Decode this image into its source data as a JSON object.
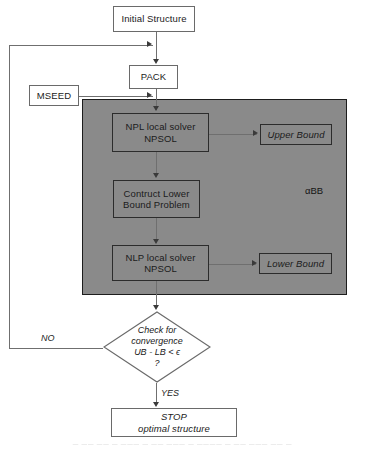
{
  "diagram": {
    "colors": {
      "page_background": "#ffffff",
      "node_fill": "#ffffff",
      "node_border": "#6a6a6a",
      "region_fill": "#8a8a8a",
      "region_border": "#1d1d1d",
      "connector": "#6f6f6f",
      "arrow": "#3a3a3a",
      "text": "#1b1b1b"
    },
    "nodes": [
      {
        "id": "initial-structure",
        "name": "initial-structure-box",
        "shape": "rect",
        "lines": [
          "Initial Structure"
        ],
        "italic": false,
        "on_gray": false,
        "x": 113,
        "y": 6,
        "w": 82,
        "h": 26
      },
      {
        "id": "pack",
        "name": "pack-box",
        "shape": "rect",
        "lines": [
          "PACK"
        ],
        "italic": false,
        "on_gray": false,
        "x": 129,
        "y": 65,
        "w": 49,
        "h": 24
      },
      {
        "id": "mseed",
        "name": "mseed-box",
        "shape": "rect",
        "lines": [
          "MSEED"
        ],
        "italic": false,
        "on_gray": false,
        "x": 29,
        "y": 85,
        "w": 50,
        "h": 21
      },
      {
        "id": "npl-solver",
        "name": "npl-local-solver-box",
        "shape": "rect",
        "lines": [
          "NPL local solver",
          "NPSOL"
        ],
        "italic": false,
        "on_gray": true,
        "x": 112,
        "y": 113,
        "w": 97,
        "h": 39
      },
      {
        "id": "upper-bound",
        "name": "upper-bound-box",
        "shape": "rect",
        "lines": [
          "Upper Bound"
        ],
        "italic": true,
        "on_gray": true,
        "x": 260,
        "y": 124,
        "w": 72,
        "h": 21
      },
      {
        "id": "contruct-lower-bound",
        "name": "construct-lower-bound-problem-box",
        "shape": "rect",
        "lines": [
          "Contruct Lower",
          "Bound Problem"
        ],
        "italic": false,
        "on_gray": true,
        "x": 113,
        "y": 180,
        "w": 87,
        "h": 38
      },
      {
        "id": "nlp-solver",
        "name": "nlp-local-solver-box",
        "shape": "rect",
        "lines": [
          "NLP local solver",
          "NPSOL"
        ],
        "italic": false,
        "on_gray": true,
        "x": 112,
        "y": 245,
        "w": 97,
        "h": 36
      },
      {
        "id": "lower-bound",
        "name": "lower-bound-box",
        "shape": "rect",
        "lines": [
          "Lower Bound"
        ],
        "italic": true,
        "on_gray": true,
        "x": 259,
        "y": 253,
        "w": 73,
        "h": 21
      },
      {
        "id": "stop",
        "name": "stop-box",
        "shape": "rect",
        "lines": [
          "STOP",
          "optimal structure"
        ],
        "italic": true,
        "on_gray": false,
        "x": 111,
        "y": 408,
        "w": 126,
        "h": 29
      }
    ],
    "region": {
      "id": "abb-region",
      "name": "alpha-bb-region",
      "label": "αBB",
      "x": 82,
      "y": 99,
      "w": 265,
      "h": 196,
      "label_x": 305,
      "label_y": 185
    },
    "decision": {
      "id": "convergence-check",
      "name": "convergence-decision-diamond",
      "lines": [
        "Check for",
        "convergence",
        "UB - LB < ϵ",
        "?"
      ],
      "x": 103,
      "y": 311,
      "w": 108,
      "h": 72
    },
    "edge_labels": [
      {
        "name": "edge-label-no",
        "text": "NO",
        "x": 41,
        "y": 333
      },
      {
        "name": "edge-label-yes",
        "text": "YES",
        "x": 161,
        "y": 388
      }
    ],
    "connectors": [
      {
        "name": "connector-initial-to-pack",
        "type": "v",
        "x": 156,
        "y": 32,
        "len": 27
      },
      {
        "name": "connector-loop-riser",
        "type": "v",
        "x": 9,
        "y": 45,
        "len": 304
      },
      {
        "name": "connector-loop-top",
        "type": "h",
        "x": 9,
        "y": 45,
        "len": 144
      },
      {
        "name": "connector-mseed-out",
        "type": "h",
        "x": 79,
        "y": 96,
        "len": 74
      },
      {
        "name": "connector-pack-to-npl",
        "type": "v",
        "x": 156,
        "y": 89,
        "len": 21
      },
      {
        "name": "connector-npl-to-upper",
        "type": "h",
        "x": 209,
        "y": 134,
        "len": 48
      },
      {
        "name": "connector-npl-to-construct",
        "type": "v",
        "x": 156,
        "y": 152,
        "len": 23
      },
      {
        "name": "connector-construct-to-nlp",
        "type": "v",
        "x": 156,
        "y": 218,
        "len": 22
      },
      {
        "name": "connector-nlp-to-lower",
        "type": "h",
        "x": 209,
        "y": 264,
        "len": 47
      },
      {
        "name": "connector-nlp-to-decision",
        "type": "v",
        "x": 156,
        "y": 281,
        "len": 26
      },
      {
        "name": "connector-no-branch",
        "type": "h",
        "x": 9,
        "y": 348,
        "len": 94
      },
      {
        "name": "connector-yes-to-stop",
        "type": "v",
        "x": 156,
        "y": 383,
        "len": 21
      }
    ],
    "arrows": [
      {
        "name": "arrowhead-into-pack-loop",
        "dir": "right",
        "x": 147,
        "y": 41
      },
      {
        "name": "arrowhead-into-pack",
        "dir": "down",
        "x": 153,
        "y": 59
      },
      {
        "name": "arrowhead-mseed-into-npl",
        "dir": "right",
        "x": 147,
        "y": 92
      },
      {
        "name": "arrowhead-into-npl",
        "dir": "down",
        "x": 153,
        "y": 106
      },
      {
        "name": "arrowhead-into-upper-bound",
        "dir": "right",
        "x": 253,
        "y": 130
      },
      {
        "name": "arrowhead-into-construct",
        "dir": "down",
        "x": 153,
        "y": 173
      },
      {
        "name": "arrowhead-into-nlp",
        "dir": "down",
        "x": 153,
        "y": 239
      },
      {
        "name": "arrowhead-into-lower-bound",
        "dir": "right",
        "x": 252,
        "y": 260
      },
      {
        "name": "arrowhead-into-decision",
        "dir": "down",
        "x": 153,
        "y": 305
      },
      {
        "name": "arrowhead-into-stop",
        "dir": "down",
        "x": 153,
        "y": 402
      }
    ],
    "scan_caption": {
      "name": "scan-artifact-caption",
      "text": "— —— —— — ——— — —— ——— — ———— — —— ——— —— —",
      "y": 441
    }
  }
}
